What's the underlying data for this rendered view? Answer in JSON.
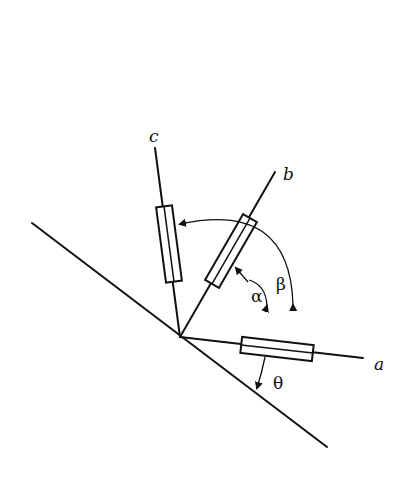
{
  "diagram": {
    "type": "strain-gauge rosette on inclined surface",
    "axis_labels": {
      "a": "a",
      "b": "b",
      "c": "c"
    },
    "angle_labels": {
      "alpha": "α",
      "beta": "β",
      "theta": "θ"
    },
    "colors": {
      "stroke": "#111111",
      "background": "#ffffff"
    }
  }
}
